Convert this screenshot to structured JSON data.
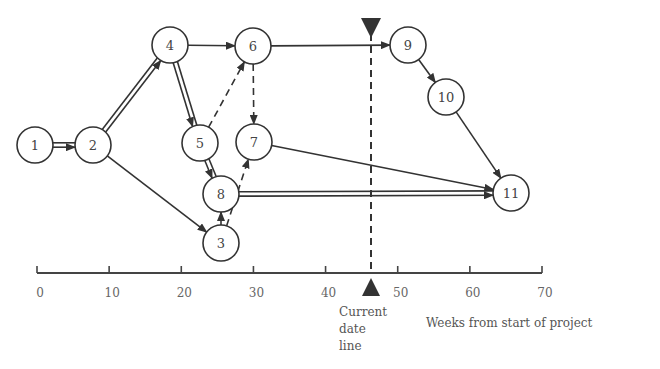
{
  "diagram": {
    "type": "project network (CPM/PERT)",
    "nodes": [
      {
        "id": "1",
        "x": 35,
        "y": 145
      },
      {
        "id": "2",
        "x": 93,
        "y": 145
      },
      {
        "id": "3",
        "x": 221,
        "y": 243
      },
      {
        "id": "4",
        "x": 170,
        "y": 45
      },
      {
        "id": "5",
        "x": 200,
        "y": 143
      },
      {
        "id": "6",
        "x": 253,
        "y": 46
      },
      {
        "id": "7",
        "x": 254,
        "y": 142
      },
      {
        "id": "8",
        "x": 221,
        "y": 194
      },
      {
        "id": "9",
        "x": 408,
        "y": 45
      },
      {
        "id": "10",
        "x": 446,
        "y": 97
      },
      {
        "id": "11",
        "x": 511,
        "y": 193
      }
    ],
    "edges": [
      {
        "from": "1",
        "to": "2",
        "style": "double"
      },
      {
        "from": "2",
        "to": "4",
        "style": "double"
      },
      {
        "from": "2",
        "to": "3",
        "style": "single"
      },
      {
        "from": "4",
        "to": "6",
        "style": "single"
      },
      {
        "from": "4",
        "to": "5",
        "style": "double"
      },
      {
        "from": "5",
        "to": "6",
        "style": "dashed"
      },
      {
        "from": "6",
        "to": "7",
        "style": "dashed"
      },
      {
        "from": "6",
        "to": "9",
        "style": "single"
      },
      {
        "from": "5",
        "to": "8",
        "style": "double"
      },
      {
        "from": "3",
        "to": "8",
        "style": "single"
      },
      {
        "from": "3",
        "to": "7",
        "style": "dashed"
      },
      {
        "from": "7",
        "to": "11",
        "style": "single"
      },
      {
        "from": "8",
        "to": "11",
        "style": "double"
      },
      {
        "from": "9",
        "to": "10",
        "style": "single"
      },
      {
        "from": "10",
        "to": "11",
        "style": "single"
      }
    ],
    "axis": {
      "ticks": [
        "0",
        "10",
        "20",
        "30",
        "40",
        "50",
        "60",
        "70"
      ],
      "label": "Weeks from start of project"
    },
    "current_date": {
      "week": 46,
      "label_lines": [
        "Current",
        "date",
        "line"
      ]
    }
  }
}
